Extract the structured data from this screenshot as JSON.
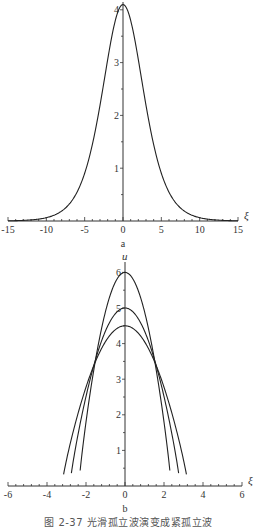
{
  "chart_data": [
    {
      "type": "line",
      "panel_label": "a",
      "title": "",
      "xlabel": "ξ",
      "ylabel": "",
      "xlim": [
        -15,
        15
      ],
      "ylim": [
        0,
        4.1
      ],
      "x_ticks": [
        -15,
        -10,
        -5,
        0,
        5,
        10,
        15
      ],
      "y_ticks": [
        1,
        2,
        3,
        4
      ],
      "grid": false,
      "legend": null,
      "series": [
        {
          "name": "smooth solitary wave",
          "x": [
            -15,
            -10,
            -8,
            -7,
            -6,
            -5,
            -4,
            -3,
            -2,
            -1,
            0,
            1,
            2,
            3,
            4,
            5,
            6,
            7,
            8,
            10,
            15
          ],
          "values": [
            0,
            0.01,
            0.05,
            0.15,
            0.35,
            0.75,
            1.4,
            2.2,
            3.05,
            3.75,
            4.1,
            3.75,
            3.05,
            2.2,
            1.4,
            0.75,
            0.35,
            0.15,
            0.05,
            0.01,
            0
          ]
        }
      ]
    },
    {
      "type": "line",
      "panel_label": "b",
      "title": "",
      "xlabel": "ξ",
      "ylabel": "u",
      "xlim": [
        -6,
        6
      ],
      "ylim": [
        0,
        6
      ],
      "x_ticks": [
        -6,
        -4,
        -2,
        0,
        2,
        4,
        6
      ],
      "y_ticks": [
        1,
        2,
        3,
        4,
        5,
        6
      ],
      "grid": false,
      "legend": null,
      "series": [
        {
          "name": "peak 6",
          "peak": 6.0,
          "half_width": 2.3,
          "end_u": 0.15
        },
        {
          "name": "peak 5",
          "peak": 5.0,
          "half_width": 2.75,
          "end_u": 0.15
        },
        {
          "name": "peak 4.5",
          "peak": 4.5,
          "half_width": 3.15,
          "end_u": 0.15
        }
      ]
    }
  ],
  "labels": {
    "panel_a": "a",
    "panel_b": "b",
    "xi": "ξ",
    "u": "u",
    "caption": "图 2-37   光滑孤立波演变成紧孤立波"
  }
}
